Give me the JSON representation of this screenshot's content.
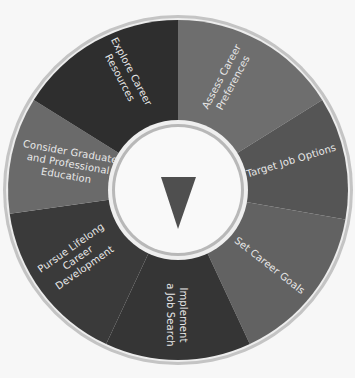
{
  "diagram": {
    "type": "career-planning-wheel",
    "center_icon": "down-triangle-icon",
    "colors": {
      "background": "#f7f7f7",
      "outer_ring": "#bdbdbd",
      "inner_ring": "#b8b8b8",
      "center_fill": "#f9f9f9",
      "triangle": "#4f4f4f",
      "label_text": "#e8e8e8"
    },
    "segments": [
      {
        "id": "assess",
        "lines": [
          "Assess Career",
          "Preferences"
        ],
        "color": "#6e6e6e"
      },
      {
        "id": "target",
        "lines": [
          "Target Job Options"
        ],
        "color": "#555555"
      },
      {
        "id": "set",
        "lines": [
          "Set Career Goals"
        ],
        "color": "#626262"
      },
      {
        "id": "implement",
        "lines": [
          "Implement",
          "a Job Search"
        ],
        "color": "#353535"
      },
      {
        "id": "pursue",
        "lines": [
          "Pursue Lifelong",
          "Career",
          "Development"
        ],
        "color": "#3a3a3a"
      },
      {
        "id": "consider",
        "lines": [
          "Consider Graduate",
          "and Professional",
          "Education"
        ],
        "color": "#6a6a6a"
      },
      {
        "id": "explore",
        "lines": [
          "Explore Career",
          "Resources"
        ],
        "color": "#2e2e2e"
      }
    ]
  }
}
